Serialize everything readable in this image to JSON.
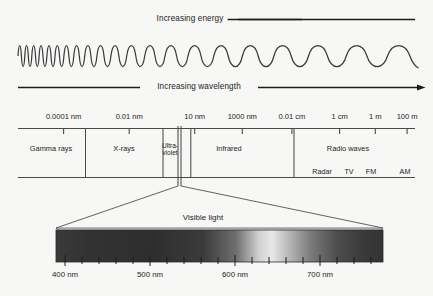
{
  "figure": {
    "background_color": "#f7f7f5",
    "ink_color": "#1d1d1d"
  },
  "energy_arrow": {
    "label": "Increasing energy",
    "direction": "left",
    "icon": "arrow-left-icon"
  },
  "wavelength_arrow": {
    "label": "Increasing wavelength",
    "direction": "right",
    "icon": "arrow-right-icon"
  },
  "wave": {
    "description": "chirp sine wave, wavelength increasing left to right",
    "cycles": 17
  },
  "scale": {
    "ticks": [
      {
        "label": "0.0001 nm",
        "x_pct": 11.5
      },
      {
        "label": "0.01 nm",
        "x_pct": 28.0
      },
      {
        "label": "10 nm",
        "x_pct": 44.5
      },
      {
        "label": "1000 nm",
        "x_pct": 56.5
      },
      {
        "label": "0.01 cm",
        "x_pct": 69.0
      },
      {
        "label": "1 cm",
        "x_pct": 81.0
      },
      {
        "label": "1 m",
        "x_pct": 90.0
      },
      {
        "label": "100 m",
        "x_pct": 98.0
      }
    ]
  },
  "bands": [
    {
      "name": "Gamma rays",
      "label": "Gamma rays",
      "start_pct": 0.0,
      "end_pct": 17.0
    },
    {
      "name": "X-rays",
      "label": "X-rays",
      "start_pct": 17.0,
      "end_pct": 36.5
    },
    {
      "name": "Ultraviolet",
      "label": "Ultra-\nviolet",
      "line1": "Ultra-",
      "line2": "violet",
      "start_pct": 36.5,
      "end_pct": 43.5
    },
    {
      "name": "Infrared",
      "label": "Infrared",
      "start_pct": 44.5,
      "end_pct": 70.5
    },
    {
      "name": "Radio waves",
      "label": "Radio waves",
      "start_pct": 70.5,
      "end_pct": 100.0
    }
  ],
  "radio_sublabels": [
    {
      "label": "Radar",
      "x_pct": 76.5
    },
    {
      "label": "TV",
      "x_pct": 84.0
    },
    {
      "label": "FM",
      "x_pct": 89.5
    },
    {
      "label": "AM",
      "x_pct": 98.0
    }
  ],
  "visible_light": {
    "label": "Visible light",
    "marker_x_pct": 41.2,
    "bar_left_px": 56,
    "bar_right_px": 383,
    "gradient_stops": [
      {
        "pos_pct": 0,
        "color": "#3a3a3a"
      },
      {
        "pos_pct": 10,
        "color": "#323232"
      },
      {
        "pos_pct": 30,
        "color": "#2e2e2e"
      },
      {
        "pos_pct": 45,
        "color": "#3b3b3b"
      },
      {
        "pos_pct": 55,
        "color": "#6e6e6e"
      },
      {
        "pos_pct": 62,
        "color": "#cfcfcf"
      },
      {
        "pos_pct": 66,
        "color": "#e8e8e8"
      },
      {
        "pos_pct": 70,
        "color": "#c2c2c2"
      },
      {
        "pos_pct": 78,
        "color": "#7a7a7a"
      },
      {
        "pos_pct": 86,
        "color": "#4d4d4d"
      },
      {
        "pos_pct": 94,
        "color": "#3a3a3a"
      },
      {
        "pos_pct": 100,
        "color": "#333333"
      }
    ],
    "wavelength_ticks": [
      {
        "label": "400 nm",
        "x_pct": 10.0,
        "major": true
      },
      {
        "label": "500 nm",
        "x_pct": 36.5,
        "major": true
      },
      {
        "label": "600 nm",
        "x_pct": 62.5,
        "major": true
      },
      {
        "label": "700 nm",
        "x_pct": 88.5,
        "major": true
      }
    ],
    "minor_tick_count": 16
  }
}
